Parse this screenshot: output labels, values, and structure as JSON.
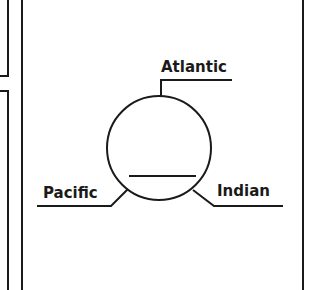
{
  "diagram": {
    "labels": {
      "atlantic": "Atlantic",
      "pacific": "Pacific",
      "indian": "Indian"
    },
    "colors": {
      "line": "#1a1a1a",
      "background": "#ffffff"
    }
  }
}
